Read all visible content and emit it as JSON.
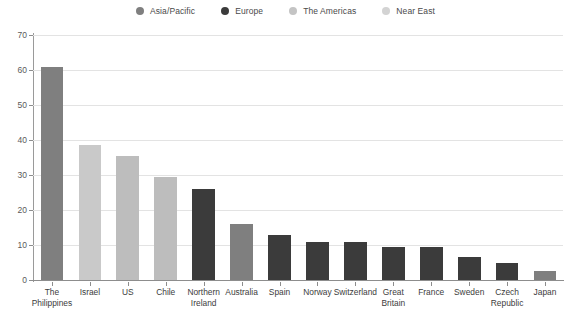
{
  "chart_data": {
    "type": "bar",
    "title": "",
    "subtitle": "",
    "xlabel": "",
    "ylabel": "",
    "ylim": [
      0,
      70
    ],
    "ytick_values": [
      0,
      10,
      20,
      30,
      40,
      50,
      60,
      70
    ],
    "ytick_labels": [
      "0",
      "10",
      "20",
      "30",
      "40",
      "50",
      "60",
      "70"
    ],
    "grid": true,
    "grid_axis": "y",
    "legend_position": "top-center",
    "categories": [
      "The Philippines",
      "Israel",
      "US",
      "Chile",
      "Northern Ireland",
      "Australia",
      "Spain",
      "Norway",
      "Switzerland",
      "Great Britain",
      "France",
      "Sweden",
      "Czech Republic",
      "Japan"
    ],
    "category_label_lines": [
      [
        "The",
        "Philippines"
      ],
      [
        "Israel"
      ],
      [
        "US"
      ],
      [
        "Chile"
      ],
      [
        "Northern",
        "Ireland"
      ],
      [
        "Australia"
      ],
      [
        "Spain"
      ],
      [
        "Norway"
      ],
      [
        "Switzerland"
      ],
      [
        "Great",
        "Britain"
      ],
      [
        "France"
      ],
      [
        "Sweden"
      ],
      [
        "Czech",
        "Republic"
      ],
      [
        "Japan"
      ]
    ],
    "values": [
      61,
      38.5,
      35.5,
      29.5,
      26,
      16,
      13,
      11,
      10.8,
      9.5,
      9.3,
      6.5,
      5,
      2.5
    ],
    "point_groups": [
      "Asia/Pacific",
      "Near East",
      "The Americas",
      "The Americas",
      "Europe",
      "Asia/Pacific",
      "Europe",
      "Europe",
      "Europe",
      "Europe",
      "Europe",
      "Europe",
      "Europe",
      "Asia/Pacific"
    ],
    "series": [
      {
        "name": "Asia/Pacific",
        "color": "#7f7f7f",
        "values": [
          61,
          null,
          null,
          null,
          null,
          16,
          null,
          null,
          null,
          null,
          null,
          null,
          null,
          2.5
        ]
      },
      {
        "name": "Europe",
        "color": "#3b3b3b",
        "values": [
          null,
          null,
          null,
          null,
          26,
          null,
          13,
          11,
          10.8,
          9.5,
          9.3,
          6.5,
          5,
          null
        ]
      },
      {
        "name": "The Americas",
        "color": "#bdbdbd",
        "values": [
          null,
          null,
          35.5,
          29.5,
          null,
          null,
          null,
          null,
          null,
          null,
          null,
          null,
          null,
          null
        ]
      },
      {
        "name": "Near East",
        "color": "#c9c9c9",
        "values": [
          null,
          38.5,
          null,
          null,
          null,
          null,
          null,
          null,
          null,
          null,
          null,
          null,
          null,
          null
        ]
      }
    ],
    "legend": [
      {
        "label": "Asia/Pacific",
        "color": "#7f7f7f",
        "marker": "circle"
      },
      {
        "label": "Europe",
        "color": "#3b3b3b",
        "marker": "circle"
      },
      {
        "label": "The Americas",
        "color": "#c4c4c4",
        "marker": "circle"
      },
      {
        "label": "Near East",
        "color": "#d3d3d3",
        "marker": "circle"
      }
    ],
    "colors": {
      "asia_pacific": "#7f7f7f",
      "europe": "#3b3b3b",
      "the_americas": "#bdbdbd",
      "near_east": "#c9c9c9",
      "grid": "#e3e3e3",
      "axis": "#8d8d8d",
      "text": "#3c3c3c",
      "background": "#ffffff"
    }
  }
}
